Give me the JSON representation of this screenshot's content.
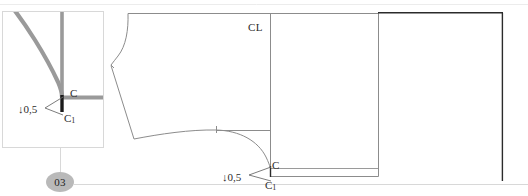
{
  "page": {
    "width": 528,
    "height": 196,
    "background": "#ffffff",
    "kind": "sewing-pattern-technical-drawing"
  },
  "step_marker": {
    "number": "03",
    "fill_color": "#b9b9b9",
    "text_color": "#232323"
  },
  "detail_callout": {
    "name": "detail-inset-box",
    "border_color": "#d8d8d8",
    "emphasis_color": "#9a9a9a",
    "accent_color": "#1a1a1a",
    "labels": {
      "point_c": "C",
      "point_c1_base": "C",
      "point_c1_sub": "1"
    },
    "dimension": {
      "arrow": "↓",
      "value": "0,5"
    }
  },
  "main_drawing": {
    "name": "pattern-block-main",
    "line_color": "#8c8c8c",
    "dark_line_color": "#2b2b2b",
    "center_line_label": "CL",
    "labels": {
      "point_c": "C",
      "point_c1_base": "C",
      "point_c1_sub": "1"
    },
    "dimension": {
      "arrow": "↓",
      "value": "0,5"
    }
  },
  "guides": {
    "leader_color": "#6d6d6d",
    "construction_color": "#d4d4d4"
  }
}
